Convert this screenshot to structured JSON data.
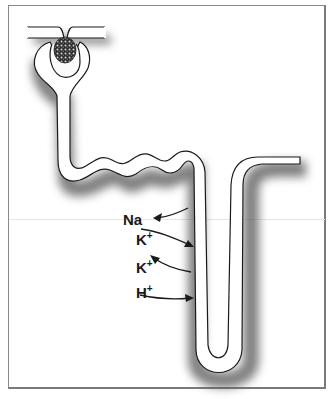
{
  "figure": {
    "labels": [
      {
        "id": "na",
        "text": "Na",
        "superscript": "",
        "direction": "reabsorbed-from-tubule"
      },
      {
        "id": "k1",
        "text": "K",
        "superscript": "+",
        "direction": "secreted-into-tubule"
      },
      {
        "id": "k2",
        "text": "K",
        "superscript": "+",
        "direction": "reabsorbed-from-tubule"
      },
      {
        "id": "h",
        "text": "H",
        "superscript": "+",
        "direction": "secreted-into-tubule"
      }
    ],
    "structures": [
      "afferent-arteriole",
      "efferent-arteriole",
      "glomerulus",
      "bowman-capsule",
      "proximal-tubule",
      "loop-tubule",
      "collecting-segment"
    ],
    "colors": {
      "outline": "#1a1a1a",
      "tube_fill": "#ffffff",
      "shadow": "#555555",
      "frame": "#8a8a8a",
      "glomerulus": "#2b2b2b"
    }
  }
}
